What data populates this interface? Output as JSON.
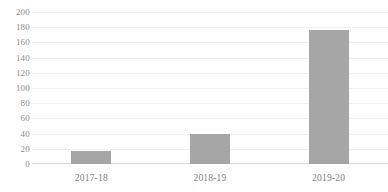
{
  "chart_data": {
    "type": "bar",
    "title": "",
    "subtitle": "",
    "xlabel": "",
    "ylabel": "",
    "categories": [
      "2017-18",
      "2018-19",
      "2019-20"
    ],
    "values": [
      17,
      40,
      176
    ],
    "series": [
      {
        "name": "Series 1",
        "values": [
          17,
          40,
          176
        ],
        "color": "#a6a6a6"
      }
    ],
    "ylim": [
      0,
      200
    ],
    "ytick_step": 20,
    "ytick_labels": [
      "200",
      "180",
      "160",
      "140",
      "120",
      "100",
      "80",
      "60",
      "40",
      "20",
      "0"
    ],
    "ytick_values": [
      200,
      180,
      160,
      140,
      120,
      100,
      80,
      60,
      40,
      20,
      0
    ],
    "grid": true,
    "grid_axis": "y",
    "legend": false,
    "legend_position": "none",
    "annotations": [],
    "data_labels": false
  },
  "style": {
    "bar_color": "#a6a6a6",
    "grid_color": "#f1f1f1",
    "baseline_color": "#dcdcdc",
    "ytick_text_color": "#8c8c8c",
    "xtick_text_color": "#7f7f7f",
    "background": "#ffffff"
  }
}
